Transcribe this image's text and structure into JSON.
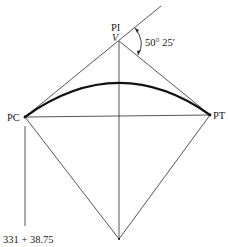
{
  "diagram": {
    "labels": {
      "pi": "PI",
      "vertex": "V",
      "angle": "50° 25′",
      "pc": "PC",
      "pt": "PT",
      "station": "331 + 38.75"
    },
    "points": {
      "V": [
        119,
        41
      ],
      "PC": [
        25,
        117
      ],
      "PT": [
        210,
        115
      ],
      "O": [
        119,
        239
      ],
      "ext_end": [
        161,
        6
      ]
    },
    "colors": {
      "line": "#2a2a2a",
      "curve": "#111111",
      "background": "#ffffff"
    }
  }
}
